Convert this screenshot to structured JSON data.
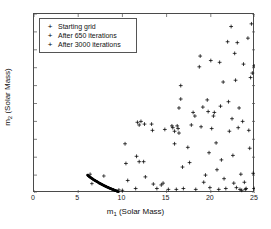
{
  "chart_data": {
    "type": "scatter",
    "title": "",
    "xlabel": "m_1 (Solar Mass)",
    "ylabel": "m_2 (Solar Mass)",
    "xlim": [
      0,
      25
    ],
    "ylim": [
      4,
      24
    ],
    "xticks": [
      0,
      5,
      10,
      15,
      20,
      25
    ],
    "yticks": [
      4,
      6,
      8,
      10,
      12,
      14,
      16,
      18,
      20,
      22,
      24
    ],
    "grid": false,
    "legend_position": "upper left",
    "series": [
      {
        "name": "Starting grid",
        "marker": "dot",
        "color": "#000000",
        "points": []
      },
      {
        "name": "After 650 iterations",
        "marker": "plus",
        "color": "#000000",
        "points": [
          [
            10.3,
            9.5
          ],
          [
            10.4,
            7.3
          ],
          [
            10.6,
            5.4
          ],
          [
            11.6,
            8.1
          ],
          [
            11.7,
            11.9
          ],
          [
            11.9,
            11.6
          ],
          [
            11.9,
            7.5
          ],
          [
            12.4,
            7.5
          ],
          [
            12.5,
            11.7
          ],
          [
            12.6,
            5.8
          ],
          [
            13.3,
            11.7
          ],
          [
            13.4,
            11.0
          ],
          [
            13.5,
            5.0
          ],
          [
            14.4,
            4.9
          ],
          [
            14.6,
            5.1
          ],
          [
            15.6,
            11.5
          ],
          [
            15.7,
            11.3
          ],
          [
            15.9,
            10.9
          ],
          [
            15.9,
            9.5
          ],
          [
            16.2,
            11.5
          ],
          [
            16.3,
            11.2
          ],
          [
            16.4,
            10.7
          ],
          [
            16.4,
            13.5
          ],
          [
            16.6,
            16.0
          ],
          [
            16.6,
            14.5
          ],
          [
            16.8,
            6.9
          ],
          [
            16.9,
            4.5
          ],
          [
            17.4,
            9.1
          ],
          [
            17.6,
            7.4
          ],
          [
            18.0,
            13.0
          ],
          [
            18.2,
            12.6
          ],
          [
            18.7,
            18.1
          ],
          [
            18.8,
            19.3
          ],
          [
            18.9,
            11.4
          ],
          [
            19.1,
            13.6
          ],
          [
            19.2,
            5.2
          ],
          [
            19.4,
            6.0
          ],
          [
            19.6,
            14.4
          ],
          [
            19.7,
            13.1
          ],
          [
            19.8,
            8.5
          ],
          [
            20.0,
            18.8
          ],
          [
            20.1,
            11.2
          ],
          [
            20.3,
            12.6
          ],
          [
            20.4,
            13.0
          ],
          [
            20.6,
            9.6
          ],
          [
            20.7,
            6.6
          ],
          [
            21.0,
            18.6
          ],
          [
            21.1,
            13.7
          ],
          [
            21.2,
            7.7
          ],
          [
            21.4,
            16.4
          ],
          [
            21.5,
            5.6
          ],
          [
            21.9,
            20.9
          ],
          [
            22.0,
            14.2
          ],
          [
            22.1,
            10.9
          ],
          [
            22.3,
            22.6
          ],
          [
            22.4,
            12.3
          ],
          [
            22.5,
            8.2
          ],
          [
            22.7,
            19.6
          ],
          [
            22.8,
            16.6
          ],
          [
            22.9,
            4.6
          ],
          [
            23.0,
            20.8
          ],
          [
            23.1,
            11.3
          ],
          [
            23.2,
            13.5
          ],
          [
            23.3,
            4.4
          ],
          [
            23.4,
            6.1
          ],
          [
            23.5,
            4.3
          ],
          [
            23.6,
            12.0
          ],
          [
            23.7,
            18.4
          ],
          [
            23.8,
            5.2
          ],
          [
            23.9,
            4.4
          ],
          [
            24.0,
            4.5
          ],
          [
            24.2,
            21.3
          ],
          [
            24.3,
            11.0
          ],
          [
            24.4,
            9.0
          ],
          [
            24.5,
            16.9
          ],
          [
            24.6,
            22.9
          ],
          [
            24.7,
            17.4
          ],
          [
            24.8,
            6.2
          ],
          [
            24.9,
            18.2
          ],
          [
            24.9,
            4.5
          ],
          [
            12.1,
            12.0
          ],
          [
            14.8,
            11.1
          ],
          [
            17.8,
            11.6
          ],
          [
            19.9,
            4.6
          ],
          [
            21.7,
            4.5
          ],
          [
            22.6,
            5.1
          ],
          [
            20.9,
            4.4
          ],
          [
            18.3,
            4.4
          ],
          [
            16.1,
            4.4
          ],
          [
            13.9,
            4.5
          ],
          [
            11.5,
            4.5
          ],
          [
            15.2,
            4.4
          ]
        ]
      },
      {
        "name": "After 3000 iterations",
        "marker": "dot-dense",
        "color": "#000000",
        "description": "dense converged arc from (6.0,6.0) to (9.3,4.0)",
        "points": [
          [
            6.05,
            6.0
          ],
          [
            6.15,
            5.92
          ],
          [
            6.25,
            5.84
          ],
          [
            6.35,
            5.77
          ],
          [
            6.45,
            5.7
          ],
          [
            6.55,
            5.63
          ],
          [
            6.65,
            5.56
          ],
          [
            6.75,
            5.49
          ],
          [
            6.85,
            5.43
          ],
          [
            6.95,
            5.37
          ],
          [
            7.05,
            5.31
          ],
          [
            7.15,
            5.25
          ],
          [
            7.25,
            5.19
          ],
          [
            7.35,
            5.13
          ],
          [
            7.45,
            5.08
          ],
          [
            7.55,
            5.02
          ],
          [
            7.65,
            4.97
          ],
          [
            7.75,
            4.92
          ],
          [
            7.85,
            4.87
          ],
          [
            7.95,
            4.82
          ],
          [
            8.05,
            4.77
          ],
          [
            8.15,
            4.72
          ],
          [
            8.25,
            4.68
          ],
          [
            8.35,
            4.63
          ],
          [
            8.45,
            4.59
          ],
          [
            8.55,
            4.54
          ],
          [
            8.65,
            4.5
          ],
          [
            8.75,
            4.46
          ],
          [
            8.85,
            4.42
          ],
          [
            8.95,
            4.38
          ],
          [
            9.05,
            4.34
          ],
          [
            9.15,
            4.3
          ],
          [
            9.25,
            4.26
          ],
          [
            9.35,
            4.22
          ],
          [
            9.45,
            4.18
          ],
          [
            9.55,
            4.14
          ],
          [
            6.1,
            5.96
          ],
          [
            6.2,
            5.88
          ],
          [
            6.3,
            5.8
          ],
          [
            6.4,
            5.73
          ],
          [
            6.5,
            5.66
          ],
          [
            6.6,
            5.59
          ],
          [
            6.7,
            5.52
          ],
          [
            6.8,
            5.46
          ],
          [
            6.9,
            5.4
          ],
          [
            7.0,
            5.34
          ],
          [
            7.1,
            5.28
          ],
          [
            7.2,
            5.22
          ],
          [
            7.3,
            5.16
          ],
          [
            7.4,
            5.1
          ],
          [
            7.5,
            5.05
          ],
          [
            7.6,
            4.99
          ],
          [
            7.7,
            4.94
          ],
          [
            7.8,
            4.89
          ],
          [
            7.9,
            4.84
          ],
          [
            8.0,
            4.79
          ],
          [
            8.1,
            4.74
          ],
          [
            8.2,
            4.7
          ],
          [
            8.3,
            4.65
          ],
          [
            8.4,
            4.61
          ],
          [
            8.5,
            4.56
          ],
          [
            8.6,
            4.52
          ],
          [
            8.7,
            4.48
          ],
          [
            8.8,
            4.44
          ],
          [
            8.9,
            4.4
          ],
          [
            9.0,
            4.36
          ],
          [
            9.1,
            4.32
          ],
          [
            9.2,
            4.28
          ],
          [
            9.3,
            4.24
          ],
          [
            9.4,
            4.2
          ]
        ]
      }
    ],
    "outlier_points_near_arc": [
      [
        6.35,
        6.1
      ],
      [
        6.55,
        5.05
      ],
      [
        7.9,
        5.9
      ],
      [
        9.6,
        4.35
      ],
      [
        10.0,
        4.3
      ]
    ]
  },
  "axes": {
    "xticklabels": [
      "0",
      "5",
      "10",
      "15",
      "20",
      "25"
    ],
    "yticklabels": [
      "4",
      "6",
      "8",
      "10",
      "12",
      "14",
      "16",
      "18",
      "20",
      "22",
      "24"
    ],
    "xlabel_main": "m",
    "xlabel_sub": "1",
    "xlabel_unit": " (Solar Mass)",
    "ylabel_main": "m",
    "ylabel_sub": "2",
    "ylabel_unit": " (Solar Mass)"
  },
  "legend": {
    "marker_glyph": "+",
    "entries": [
      {
        "label": "Starting grid"
      },
      {
        "label": "After 650 iterations"
      },
      {
        "label": "After 3000 iterations"
      }
    ]
  }
}
